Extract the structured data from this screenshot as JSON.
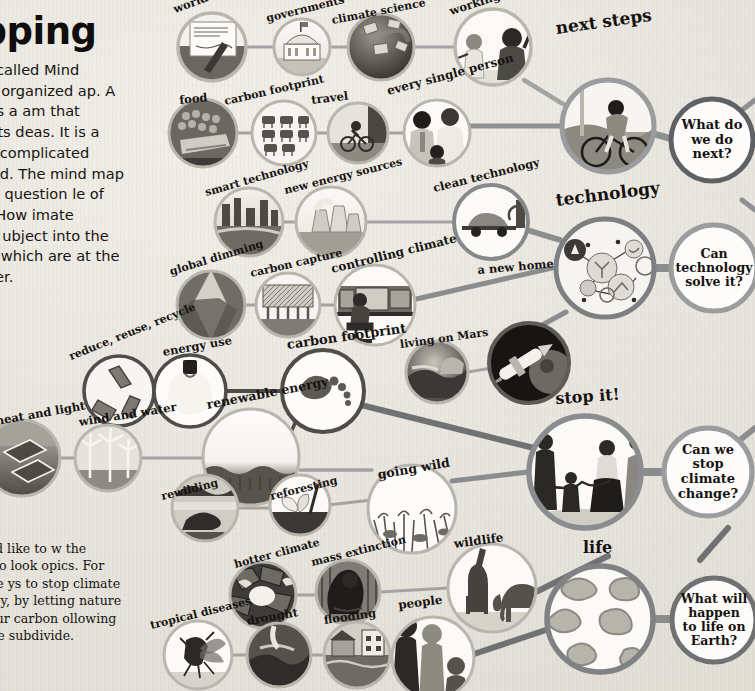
{
  "page": {
    "title": "mapping",
    "intro_paragraph": "his book is called Mind ecause it is organized ap. A mind map is a am that connects lots deas. It is a very useful complicated topics rstand. The mind map looks at the question le of this book–“How imate change?” It ubject into the eight tions, which are at the each chapter.",
    "section2_heading": "es",
    "section2_paragraph": "that you would like to w the colored lines to look opics. For example, there ys to stop climate change— nergy, by letting nature by reducing our carbon ollowing the lines to see subdivide.",
    "background_color": "#ebe8e1",
    "ink_color": "#15120f"
  },
  "colors": {
    "hub_technology": "#7d7f80",
    "hub_stop_it": "#8a8c8d",
    "hub_life": "#7f8183",
    "hub_next_steps": "#9a9c9d",
    "connector_gray": "#a3a4a2",
    "connector_dark": "#7a7c7d",
    "node_ring_light": "#b9b6ae",
    "question_ring": "#86888a"
  },
  "hubs": [
    {
      "id": "next-steps",
      "label": "next steps",
      "art": "cyclist-wind-turbine"
    },
    {
      "id": "technology",
      "label": "technology",
      "art": "tech-network-bubbles"
    },
    {
      "id": "stop-it",
      "label": "stop it!",
      "art": "family-holding-hands"
    },
    {
      "id": "life",
      "label": "life",
      "art": "microbe-amoebas"
    }
  ],
  "questions": [
    {
      "id": "q-next",
      "lines": [
        "What do",
        "we do",
        "next?"
      ]
    },
    {
      "id": "q-technology",
      "lines": [
        "Can",
        "technology",
        "solve it?"
      ]
    },
    {
      "id": "q-stop",
      "lines": [
        "Can we",
        "stop",
        "climate",
        "change?"
      ]
    },
    {
      "id": "q-life",
      "lines": [
        "What will",
        "happen",
        "to life on",
        "Earth?"
      ]
    }
  ],
  "nodes": [
    {
      "id": "world-agreements",
      "label": "world agreements",
      "art": "signed-document"
    },
    {
      "id": "governments",
      "label": "governments",
      "art": "capitol-building"
    },
    {
      "id": "climate-science",
      "label": "climate science",
      "art": "earth-satellite-data"
    },
    {
      "id": "working-together",
      "label": "working together",
      "art": "two-people-waving"
    },
    {
      "id": "food",
      "label": "food",
      "art": "market-produce"
    },
    {
      "id": "carbon-footprint-2",
      "label": "carbon footprint",
      "art": "livestock-grid"
    },
    {
      "id": "travel",
      "label": "travel",
      "art": "child-on-bicycle"
    },
    {
      "id": "every-single-person",
      "label": "every single person",
      "art": "family-portrait"
    },
    {
      "id": "smart-technology",
      "label": "smart technology",
      "art": "smart-city-river"
    },
    {
      "id": "new-energy-sources",
      "label": "new energy sources",
      "art": "cooling-towers"
    },
    {
      "id": "clean-technology",
      "label": "clean technology",
      "art": "electric-car-charging"
    },
    {
      "id": "global-dimming",
      "label": "global dimming",
      "art": "volcano-eruption"
    },
    {
      "id": "carbon-capture",
      "label": "carbon capture",
      "art": "capture-array"
    },
    {
      "id": "controlling-climate",
      "label": "controlling climate",
      "art": "scientist-at-monitors"
    },
    {
      "id": "a-new-home",
      "label": "a new home",
      "art": "rocket-and-planet"
    },
    {
      "id": "living-on-mars",
      "label": "living on Mars",
      "art": "mars-base-landscape"
    },
    {
      "id": "reduce-reuse",
      "label": "reduce, reuse, recycle",
      "art": "recycling-arrows"
    },
    {
      "id": "energy-use",
      "label": "energy use",
      "art": "light-bulb"
    },
    {
      "id": "carbon-footprint",
      "label": "carbon footprint",
      "art": "footprint"
    },
    {
      "id": "heat-and-light",
      "label": "heat and light",
      "art": "solar-panels"
    },
    {
      "id": "wind-and-water",
      "label": "wind and water",
      "art": "wind-turbines"
    },
    {
      "id": "renewable-energy",
      "label": "renewable energy",
      "art": "solar-field"
    },
    {
      "id": "rewilding",
      "label": "rewilding",
      "art": "beaver-wetland"
    },
    {
      "id": "reforesting",
      "label": "reforesting",
      "art": "seedling-planting"
    },
    {
      "id": "going-wild",
      "label": "going wild",
      "art": "wild-meadow"
    },
    {
      "id": "hotter-climate",
      "label": "hotter climate",
      "art": "cracked-dry-ground"
    },
    {
      "id": "mass-extinction",
      "label": "mass extinction",
      "art": "gorilla"
    },
    {
      "id": "wildlife",
      "label": "wildlife",
      "art": "giraffe-elephant"
    },
    {
      "id": "tropical-diseases",
      "label": "tropical diseases",
      "art": "mosquito"
    },
    {
      "id": "drought",
      "label": "drought",
      "art": "dry-riverbed"
    },
    {
      "id": "flooding",
      "label": "flooding",
      "art": "flooded-houses"
    },
    {
      "id": "people",
      "label": "people",
      "art": "crowd-silhouettes"
    }
  ]
}
